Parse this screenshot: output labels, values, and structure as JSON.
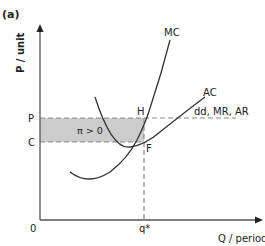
{
  "figure": {
    "panel_label": "(a)",
    "y_axis_label": "P / unit",
    "x_axis_label": "Q / period",
    "origin_label": "0",
    "price_label": "P",
    "cost_label": "C",
    "quantity_label": "q*",
    "point_h": "H",
    "point_f": "F",
    "profit_label": "π > 0",
    "curves": {
      "mc": "MC",
      "ac": "AC",
      "demand": "dd, MR, AR"
    },
    "colors": {
      "line": "#333333",
      "dashed": "#888888",
      "profit_fill": "#cccccc"
    }
  }
}
